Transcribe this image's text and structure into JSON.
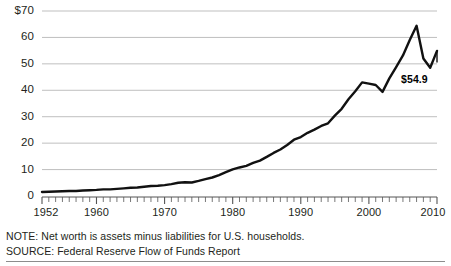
{
  "chart_data": {
    "type": "line",
    "title": "",
    "subtitle": "",
    "xlabel": "",
    "ylabel": "",
    "units": "trillions of dollars",
    "grid": true,
    "legend": null,
    "xlim": [
      1952,
      2010
    ],
    "ylim": [
      0,
      70
    ],
    "y_ticks": [
      0,
      10,
      20,
      30,
      40,
      50,
      60,
      70
    ],
    "y_tick_labels": [
      "0",
      "10",
      "20",
      "30",
      "40",
      "50",
      "60",
      "$70"
    ],
    "x_ticks": [
      1952,
      1960,
      1970,
      1980,
      1990,
      2000,
      2010
    ],
    "x_tick_labels": [
      "1952",
      "1960",
      "1970",
      "1980",
      "1990",
      "2000",
      "2010"
    ],
    "x_minor_tick_interval": 1,
    "series_name": "U.S. household net worth",
    "line_color": "#111111",
    "gridline_color": "#b8b8b8",
    "annotations": [
      {
        "label": "$54.9",
        "x": 2010,
        "y": 54.9
      }
    ],
    "x": [
      1952,
      1953,
      1954,
      1955,
      1956,
      1957,
      1958,
      1959,
      1960,
      1961,
      1962,
      1963,
      1964,
      1965,
      1966,
      1967,
      1968,
      1969,
      1970,
      1971,
      1972,
      1973,
      1974,
      1975,
      1976,
      1977,
      1978,
      1979,
      1980,
      1981,
      1982,
      1983,
      1984,
      1985,
      1986,
      1987,
      1988,
      1989,
      1990,
      1991,
      1992,
      1993,
      1994,
      1995,
      1996,
      1997,
      1998,
      1999,
      2000,
      2001,
      2002,
      2003,
      2004,
      2005,
      2006,
      2007,
      2008,
      2009,
      2010
    ],
    "values": [
      1.5,
      1.6,
      1.7,
      1.8,
      1.9,
      1.9,
      2.1,
      2.2,
      2.3,
      2.5,
      2.5,
      2.7,
      2.9,
      3.1,
      3.2,
      3.5,
      3.8,
      3.9,
      4.1,
      4.5,
      5.0,
      5.2,
      5.1,
      5.7,
      6.4,
      7.0,
      7.9,
      9.0,
      10.1,
      10.8,
      11.4,
      12.5,
      13.4,
      14.8,
      16.3,
      17.6,
      19.3,
      21.3,
      22.3,
      23.9,
      25.1,
      26.5,
      27.5,
      30.4,
      33.0,
      36.6,
      39.6,
      43.0,
      42.5,
      42.0,
      39.4,
      44.5,
      48.8,
      53.2,
      59.0,
      64.4,
      52.0,
      48.5,
      54.9
    ]
  },
  "footnotes": {
    "note": "NOTE: Net worth is assets minus liabilities for U.S. households.",
    "source": "SOURCE: Federal Reserve Flow of Funds Report"
  }
}
